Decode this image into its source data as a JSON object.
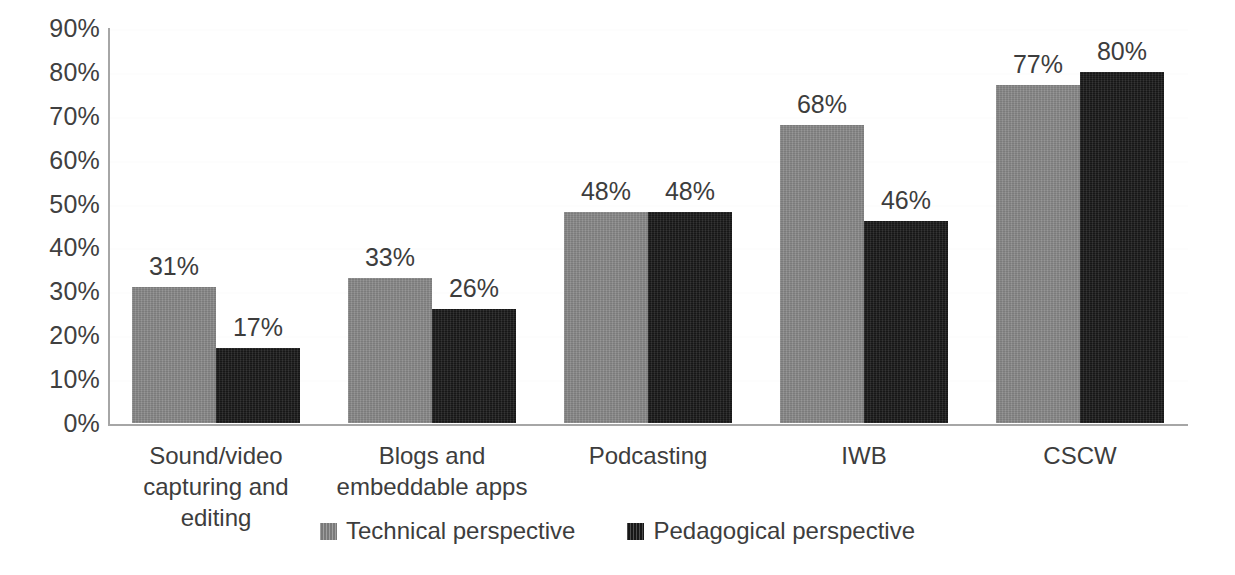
{
  "chart_data": {
    "type": "bar",
    "title": "",
    "subtitle": "",
    "xlabel": "",
    "ylabel": "",
    "ylim": [
      0,
      90
    ],
    "grid": true,
    "legend_position": "bottom-center",
    "y_ticks": [
      "0%",
      "10%",
      "20%",
      "30%",
      "40%",
      "50%",
      "60%",
      "70%",
      "80%",
      "90%"
    ],
    "y_tick_values": [
      0,
      10,
      20,
      30,
      40,
      50,
      60,
      70,
      80,
      90
    ],
    "categories": [
      "Sound/video capturing and editing",
      "Blogs and embeddable apps",
      "Podcasting",
      "IWB",
      "CSCW"
    ],
    "category_lines": [
      [
        "Sound/video",
        "capturing and editing"
      ],
      [
        "Blogs and",
        "embeddable apps"
      ],
      [
        "Podcasting",
        ""
      ],
      [
        "IWB",
        ""
      ],
      [
        "CSCW",
        ""
      ]
    ],
    "series": [
      {
        "name": "Technical perspective",
        "color": "#8a8a8a",
        "values": [
          31,
          33,
          48,
          68,
          77
        ],
        "labels": [
          "31%",
          "33%",
          "48%",
          "68%",
          "77%"
        ]
      },
      {
        "name": "Pedagogical perspective",
        "color": "#1a1a1a",
        "values": [
          17,
          26,
          48,
          46,
          80
        ],
        "labels": [
          "17%",
          "26%",
          "48%",
          "46%",
          "80%"
        ]
      }
    ]
  },
  "legend": {
    "items": [
      {
        "label": "Technical perspective",
        "color": "#8a8a8a"
      },
      {
        "label": "Pedagogical perspective",
        "color": "#1a1a1a"
      }
    ]
  },
  "colors": {
    "technical": "#8a8a8a",
    "pedagogical": "#1a1a1a",
    "axis": "#a6a6a6",
    "gridline": "#fdfdfd",
    "text": "#3d3d3d",
    "background": "#ffffff"
  }
}
